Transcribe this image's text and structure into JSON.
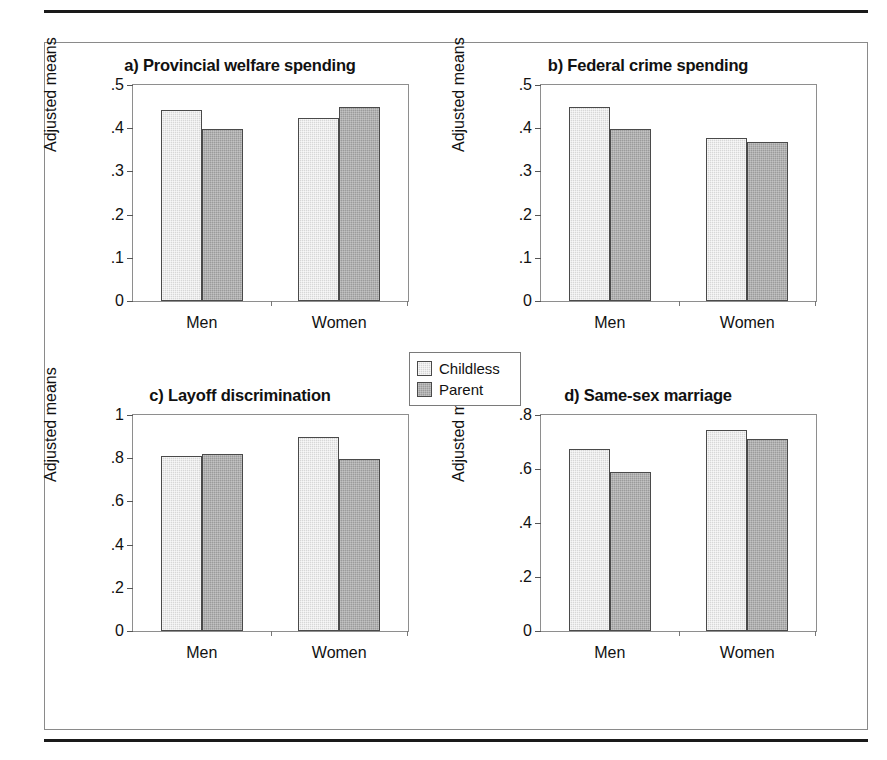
{
  "figure": {
    "y_axis_label": "Adjusted means",
    "group_labels": [
      "Men",
      "Women"
    ],
    "legend": {
      "items": [
        {
          "label": "Childless",
          "color": "#d7d7d7",
          "swatch": "childless-swatch"
        },
        {
          "label": "Parent",
          "color": "#9b9b9b",
          "swatch": "parent-swatch"
        }
      ]
    },
    "colors": {
      "childless": "#d7d7d7",
      "parent": "#9b9b9b",
      "bar_outline": "#4a4a4a",
      "frame": "#8e8e8e",
      "rule": "#1a1a1a",
      "text": "#111111"
    }
  },
  "chart_data": [
    {
      "type": "bar",
      "panel": "a",
      "title": "a) Provincial welfare spending",
      "xlabel": "",
      "ylabel": "Adjusted means",
      "categories": [
        "Men",
        "Women"
      ],
      "series": [
        {
          "name": "Childless",
          "values": [
            0.443,
            0.423
          ]
        },
        {
          "name": "Parent",
          "values": [
            0.399,
            0.448
          ]
        }
      ],
      "ylim": [
        0,
        0.5
      ],
      "yticks": [
        0,
        0.1,
        0.2,
        0.3,
        0.4,
        0.5
      ],
      "ytick_labels": [
        "0",
        ".1",
        ".2",
        ".3",
        ".4",
        ".5"
      ],
      "grid": false,
      "legend_position": "figure-center"
    },
    {
      "type": "bar",
      "panel": "b",
      "title": "b) Federal crime spending",
      "xlabel": "",
      "ylabel": "Adjusted means",
      "categories": [
        "Men",
        "Women"
      ],
      "series": [
        {
          "name": "Childless",
          "values": [
            0.448,
            0.378
          ]
        },
        {
          "name": "Parent",
          "values": [
            0.399,
            0.369
          ]
        }
      ],
      "ylim": [
        0,
        0.5
      ],
      "yticks": [
        0,
        0.1,
        0.2,
        0.3,
        0.4,
        0.5
      ],
      "ytick_labels": [
        "0",
        ".1",
        ".2",
        ".3",
        ".4",
        ".5"
      ],
      "grid": false,
      "legend_position": "figure-center"
    },
    {
      "type": "bar",
      "panel": "c",
      "title": "c) Layoff discrimination",
      "xlabel": "",
      "ylabel": "Adjusted means",
      "categories": [
        "Men",
        "Women"
      ],
      "series": [
        {
          "name": "Childless",
          "values": [
            0.81,
            0.9
          ]
        },
        {
          "name": "Parent",
          "values": [
            0.82,
            0.795
          ]
        }
      ],
      "ylim": [
        0,
        1
      ],
      "yticks": [
        0,
        0.2,
        0.4,
        0.6,
        0.8,
        1
      ],
      "ytick_labels": [
        "0",
        ".2",
        ".4",
        ".6",
        ".8",
        "1"
      ],
      "grid": false,
      "legend_position": "figure-center"
    },
    {
      "type": "bar",
      "panel": "d",
      "title": "d) Same-sex marriage",
      "xlabel": "",
      "ylabel": "Adjusted means",
      "categories": [
        "Men",
        "Women"
      ],
      "series": [
        {
          "name": "Childless",
          "values": [
            0.675,
            0.745
          ]
        },
        {
          "name": "Parent",
          "values": [
            0.59,
            0.71
          ]
        }
      ],
      "ylim": [
        0,
        0.8
      ],
      "yticks": [
        0,
        0.2,
        0.4,
        0.6,
        0.8
      ],
      "ytick_labels": [
        "0",
        ".2",
        ".4",
        ".6",
        ".8"
      ],
      "grid": false,
      "legend_position": "figure-center"
    }
  ]
}
